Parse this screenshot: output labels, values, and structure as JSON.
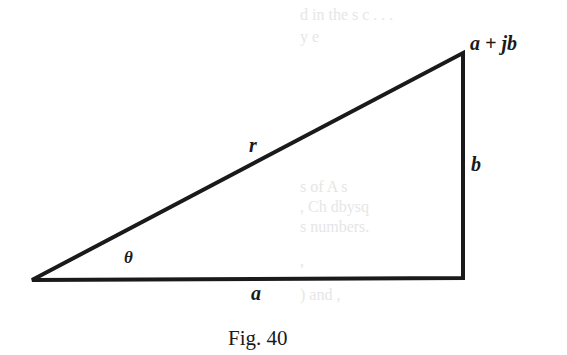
{
  "figure": {
    "caption": "Fig. 40",
    "vertices": {
      "origin": [
        32,
        280
      ],
      "right_angle": [
        463,
        278
      ],
      "apex": [
        463,
        53
      ]
    },
    "labels": {
      "apex": "a + jb",
      "hypotenuse": "r",
      "opposite": "b",
      "adjacent": "a",
      "angle": "θ"
    },
    "colors": {
      "stroke": "#1a1a1a",
      "background": "#ffffff"
    }
  }
}
